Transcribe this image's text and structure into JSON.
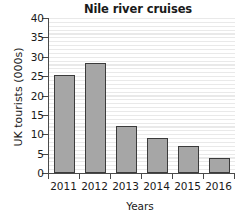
{
  "chart_data": {
    "type": "bar",
    "title": "Nile river cruises",
    "xlabel": "Years",
    "ylabel": "UK tourists (000s)",
    "categories": [
      "2011",
      "2012",
      "2013",
      "2014",
      "2015",
      "2016"
    ],
    "values": [
      25.2,
      28.3,
      12.2,
      9.0,
      7.1,
      3.8
    ],
    "series": [
      {
        "name": "UK tourists (000s)",
        "values": [
          25.2,
          28.3,
          12.2,
          9.0,
          7.1,
          3.8
        ]
      }
    ],
    "ylim": [
      0,
      40
    ],
    "ytick_labels": [
      "0",
      "5",
      "10",
      "15",
      "20",
      "25",
      "30",
      "35",
      "40"
    ],
    "ytick_values": [
      0,
      5,
      10,
      15,
      20,
      25,
      30,
      35,
      40
    ],
    "grid": "horizontal",
    "legend": "none",
    "bar_fill_color": "#a6a6a6",
    "bar_edge_color": "#3b3b3b",
    "axis_color": "#4a4a4a",
    "gridline_color": "#e9e9e9",
    "background_color": "#ffffff"
  }
}
